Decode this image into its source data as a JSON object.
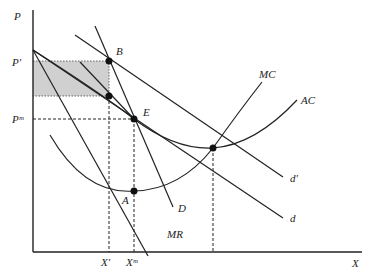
{
  "axes": {
    "y_label": "P",
    "x_label": "X"
  },
  "price_labels": {
    "p_prime": "P′",
    "p_m": "Pᵐ"
  },
  "quantity_labels": {
    "x_prime": "X′",
    "x_m": "Xᵐ"
  },
  "curves": {
    "mc": "MC",
    "ac": "AC",
    "d_prime": "d′",
    "d": "d",
    "demand": "D",
    "mr": "MR"
  },
  "points": {
    "b": "B",
    "e": "E",
    "a": "A"
  },
  "colors": {
    "shaded_area": "#c8c8c8",
    "lines": "#222222"
  }
}
